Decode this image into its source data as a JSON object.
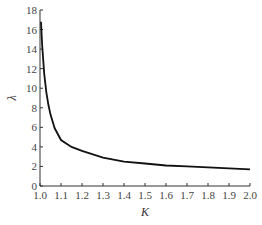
{
  "chart_data": {
    "type": "line",
    "title": "",
    "xlabel": "K",
    "ylabel": "λ",
    "xlim": [
      1.0,
      2.0
    ],
    "ylim": [
      0,
      18
    ],
    "xticks": [
      "1.0",
      "1.1",
      "1.2",
      "1.3",
      "1.4",
      "1.5",
      "1.6",
      "1.7",
      "1.8",
      "1.9",
      "2.0"
    ],
    "yticks": [
      "0",
      "2",
      "4",
      "6",
      "8",
      "10",
      "12",
      "14",
      "16",
      "18"
    ],
    "grid": false,
    "legend": null,
    "series": [
      {
        "name": "λ(K)",
        "color": "#111111",
        "x": [
          1.005,
          1.01,
          1.02,
          1.03,
          1.04,
          1.05,
          1.07,
          1.1,
          1.15,
          1.2,
          1.3,
          1.4,
          1.5,
          1.6,
          1.7,
          1.8,
          1.9,
          2.0
        ],
        "y": [
          16.8,
          14.5,
          11.5,
          9.6,
          8.3,
          7.3,
          5.9,
          4.7,
          4.0,
          3.6,
          2.9,
          2.5,
          2.3,
          2.1,
          2.0,
          1.9,
          1.8,
          1.7
        ]
      }
    ]
  }
}
